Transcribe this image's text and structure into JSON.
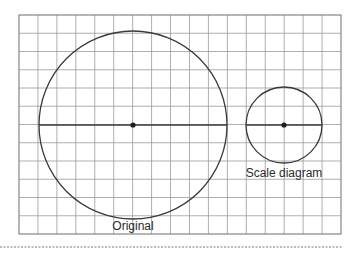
{
  "diagram": {
    "type": "scale-drawing-on-grid",
    "grid": {
      "left": 19,
      "top": 15,
      "right": 341,
      "bottom": 234,
      "columns": 17,
      "rows": 12,
      "line_color": "#9a9a9a",
      "border_color": "#7a7a7a"
    },
    "shapes": [
      {
        "id": "original",
        "kind": "circle",
        "label": "Original",
        "center": [
          133,
          125
        ],
        "radius": 94,
        "diameter_line": true,
        "center_dot": true,
        "label_pos": [
          133,
          230
        ]
      },
      {
        "id": "scale",
        "kind": "circle",
        "label": "Scale diagram",
        "center": [
          284,
          125
        ],
        "radius": 38,
        "diameter_line": true,
        "center_dot": true,
        "label_pos": [
          284,
          177
        ]
      }
    ],
    "stroke_color": "#3a3a3a",
    "dashed_rule": {
      "x1": 0,
      "x2": 343,
      "y": 247,
      "color": "#777777"
    }
  },
  "labels": {
    "original": "Original",
    "scale": "Scale diagram"
  }
}
